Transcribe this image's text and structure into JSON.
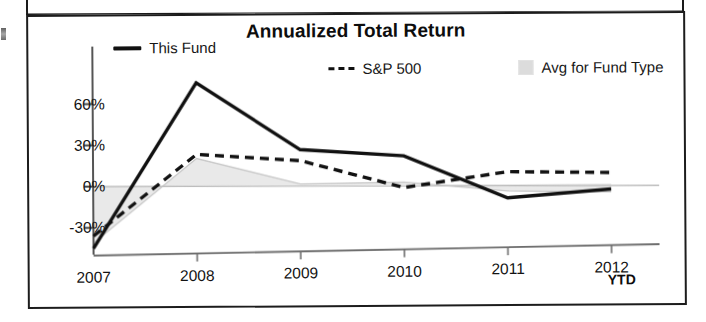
{
  "document": {
    "panel_above_present": true,
    "edge_fragment_present": true
  },
  "chart_data": {
    "type": "line",
    "title": "Annualized Total Return",
    "xlabel": "",
    "ylabel": "",
    "categories": [
      "2007",
      "2008",
      "2009",
      "2010",
      "2011",
      "2012"
    ],
    "x_axis_suffix": "YTD",
    "ylim": [
      -48,
      80
    ],
    "ytick_values": [
      60,
      30,
      0,
      -30
    ],
    "ytick_labels": [
      "60%",
      "30%",
      "0%",
      "-30%"
    ],
    "grid": false,
    "legend_position": "top",
    "zero_baseline": true,
    "series": [
      {
        "name": "This Fund",
        "style": "solid",
        "color": "#111111",
        "values": [
          -45,
          75,
          26,
          21,
          -10,
          -4
        ]
      },
      {
        "name": "S&P 500",
        "style": "dashed",
        "color": "#111111",
        "values": [
          -36,
          23,
          18,
          -2,
          9,
          8
        ]
      },
      {
        "name": "Avg for Fund Type",
        "style": "area",
        "color": "#dcdcdc",
        "values": [
          -41,
          20,
          1,
          2,
          -5,
          -6
        ]
      }
    ],
    "legend": [
      {
        "label": "This Fund",
        "marker": "solid-line"
      },
      {
        "label": "S&P 500",
        "marker": "dashed-line"
      },
      {
        "label": "Avg for Fund Type",
        "marker": "gray-swatch"
      }
    ],
    "colors": {
      "fund_line": "#111111",
      "sp500_line": "#111111",
      "avg_area": "#dcdcdc",
      "axis": "#4a4a4a",
      "frame": "#1c1c1c",
      "text": "#131313"
    }
  }
}
